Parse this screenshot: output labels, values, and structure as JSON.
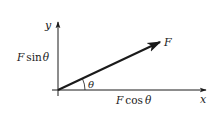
{
  "diagram": {
    "type": "vector-components",
    "axes": {
      "x_label": "x",
      "y_label": "y"
    },
    "vector": {
      "label": "F",
      "angle_label": "θ"
    },
    "components": {
      "horizontal": {
        "prefix": "F",
        "func": "cos",
        "arg": "θ"
      },
      "vertical": {
        "prefix": "F",
        "func": "sin",
        "arg": "θ"
      }
    },
    "colors": {
      "ink": "#1a1a1a",
      "background": "#ffffff"
    }
  }
}
